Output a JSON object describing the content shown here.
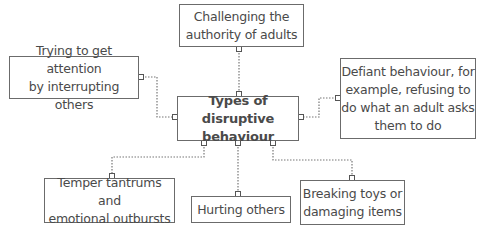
{
  "diagram": {
    "center": {
      "label": "Types of disruptive\nbehaviour"
    },
    "nodes": [
      {
        "id": "challenging-authority",
        "label": "Challenging the\nauthority of adults"
      },
      {
        "id": "attention-interrupting",
        "label": "Trying to get attention\nby interrupting others"
      },
      {
        "id": "defiant-behaviour",
        "label": "Defiant behaviour, for\nexample, refusing to\ndo what an adult asks\nthem to do"
      },
      {
        "id": "temper-tantrums",
        "label": "Temper tantrums and\nemotional outbursts"
      },
      {
        "id": "hurting-others",
        "label": "Hurting others"
      },
      {
        "id": "breaking-toys",
        "label": "Breaking toys or\ndamaging items"
      }
    ],
    "colors": {
      "border": "#6b6b6b",
      "text": "#4a4a4a",
      "connector": "#777777"
    }
  }
}
